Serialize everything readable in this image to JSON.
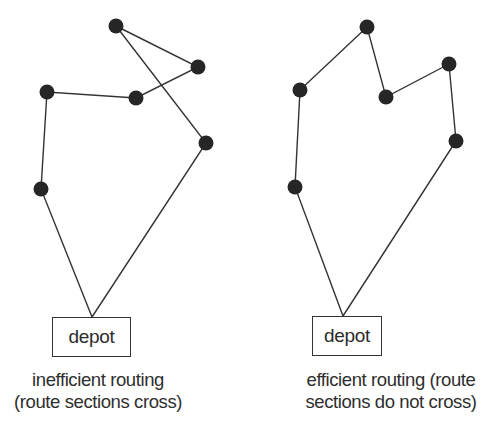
{
  "panels": [
    {
      "id": "inefficient",
      "depot_label": "depot",
      "caption_line1": "inefficient routing",
      "caption_line2": "(route sections cross)",
      "depot": {
        "x": 92,
        "y": 317
      },
      "nodes": [
        [
          116,
          26
        ],
        [
          198,
          67
        ],
        [
          136,
          98
        ],
        [
          47,
          92
        ],
        [
          41,
          189
        ],
        [
          206,
          143
        ]
      ],
      "route_order": [
        "depot",
        [
          41,
          189
        ],
        [
          47,
          92
        ],
        [
          136,
          98
        ],
        [
          198,
          67
        ],
        [
          116,
          26
        ],
        [
          206,
          143
        ],
        "depot"
      ],
      "crossing": true
    },
    {
      "id": "efficient",
      "depot_label": "depot",
      "caption_line1": "efficient routing (route",
      "caption_line2": "sections do not cross)",
      "depot": {
        "x": 343,
        "y": 316
      },
      "nodes": [
        [
          295,
          187
        ],
        [
          300,
          90
        ],
        [
          367,
          27
        ],
        [
          386,
          97
        ],
        [
          449,
          64
        ],
        [
          456,
          141
        ]
      ],
      "route_order": [
        "depot",
        [
          295,
          187
        ],
        [
          300,
          90
        ],
        [
          367,
          27
        ],
        [
          386,
          97
        ],
        [
          449,
          64
        ],
        [
          456,
          141
        ],
        "depot"
      ],
      "crossing": false
    }
  ]
}
